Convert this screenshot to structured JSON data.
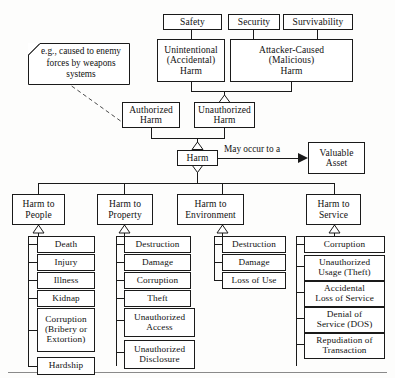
{
  "diagram": {
    "note": {
      "text": "e.g., caused to\nenemy forces by\nweapons systems"
    },
    "quality_factors": [
      {
        "id": "safety",
        "label": "Safety"
      },
      {
        "id": "security",
        "label": "Security"
      },
      {
        "id": "survivability",
        "label": "Survivability"
      }
    ],
    "harm_types": [
      {
        "id": "unintentional",
        "label": "Unintentional\n(Accidental)\nHarm"
      },
      {
        "id": "attacker_caused",
        "label": "Attacker-Caused\n(Malicious)\nHarm"
      }
    ],
    "authorization": [
      {
        "id": "authorized",
        "label": "Authorized\nHarm"
      },
      {
        "id": "unauthorized",
        "label": "Unauthorized\nHarm"
      }
    ],
    "root": {
      "id": "harm",
      "label": "Harm"
    },
    "association": {
      "label": "May occur to a",
      "target": {
        "id": "valuable_asset",
        "label": "Valuable\nAsset"
      }
    },
    "categories": [
      {
        "id": "harm_to_people",
        "label": "Harm to\nPeople",
        "children": [
          {
            "id": "death",
            "label": "Death"
          },
          {
            "id": "injury",
            "label": "Injury"
          },
          {
            "id": "illness",
            "label": "Illness"
          },
          {
            "id": "kidnap",
            "label": "Kidnap"
          },
          {
            "id": "corruption_people",
            "label": "Corruption\n(Bribery or\nExtortion)"
          },
          {
            "id": "hardship",
            "label": "Hardship"
          }
        ]
      },
      {
        "id": "harm_to_property",
        "label": "Harm to\nProperty",
        "children": [
          {
            "id": "destruction_property",
            "label": "Destruction"
          },
          {
            "id": "damage_property",
            "label": "Damage"
          },
          {
            "id": "corruption_property",
            "label": "Corruption"
          },
          {
            "id": "theft_property",
            "label": "Theft"
          },
          {
            "id": "unauthorized_access",
            "label": "Unauthorized\nAccess"
          },
          {
            "id": "unauthorized_disclosure",
            "label": "Unauthorized\nDisclosure"
          }
        ]
      },
      {
        "id": "harm_to_environment",
        "label": "Harm to\nEnvironment",
        "children": [
          {
            "id": "destruction_environment",
            "label": "Destruction"
          },
          {
            "id": "damage_environment",
            "label": "Damage"
          },
          {
            "id": "loss_of_use",
            "label": "Loss of Use"
          }
        ]
      },
      {
        "id": "harm_to_service",
        "label": "Harm to\nService",
        "children": [
          {
            "id": "corruption_service",
            "label": "Corruption"
          },
          {
            "id": "unauthorized_usage",
            "label": "Unauthorized\nUsage (Theft)"
          },
          {
            "id": "accidental_loss_of_service",
            "label": "Accidental\nLoss of Service"
          },
          {
            "id": "denial_of_service",
            "label": "Denial of\nService (DOS)"
          },
          {
            "id": "repudiation_of_transaction",
            "label": "Repudiation of\nTransaction"
          }
        ]
      }
    ],
    "colors": {
      "line": "#1a1a1a",
      "box_fill": "#ffffff",
      "page": "#fdfdfc",
      "rule": "#8a8a8a"
    }
  }
}
